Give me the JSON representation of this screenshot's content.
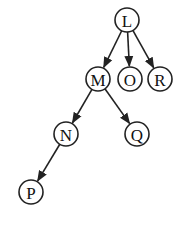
{
  "diagram": {
    "type": "directed-tree",
    "nodes": [
      {
        "id": "L",
        "label": "L",
        "x": 127,
        "y": 20
      },
      {
        "id": "M",
        "label": "M",
        "x": 98,
        "y": 79
      },
      {
        "id": "O",
        "label": "O",
        "x": 130,
        "y": 79
      },
      {
        "id": "R",
        "label": "R",
        "x": 160,
        "y": 79
      },
      {
        "id": "N",
        "label": "N",
        "x": 66,
        "y": 134
      },
      {
        "id": "Q",
        "label": "Q",
        "x": 137,
        "y": 134
      },
      {
        "id": "P",
        "label": "P",
        "x": 31,
        "y": 192
      }
    ],
    "edges": [
      {
        "from": "L",
        "to": "M"
      },
      {
        "from": "L",
        "to": "O"
      },
      {
        "from": "L",
        "to": "R"
      },
      {
        "from": "M",
        "to": "N"
      },
      {
        "from": "M",
        "to": "Q"
      },
      {
        "from": "N",
        "to": "P"
      }
    ],
    "node_radius": 12,
    "colors": {
      "stroke": "#222222",
      "fill": "#ffffff",
      "text": "#111111"
    }
  }
}
